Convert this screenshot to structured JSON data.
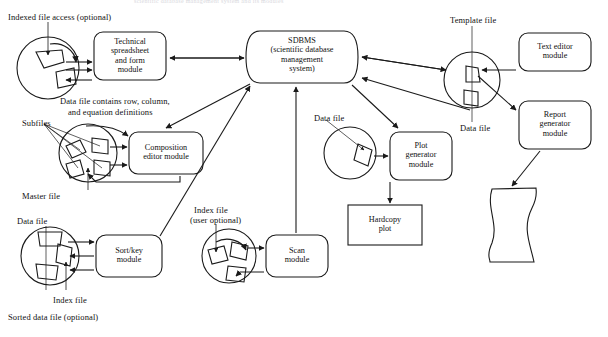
{
  "figure": {
    "top_cut_caption": "scientific database management system and its modules",
    "width": 608,
    "height": 337,
    "line_color": "#1a1a1a",
    "background": "#ffffff"
  },
  "modules": [
    {
      "id": "technical-spreadsheet",
      "lines": [
        "Technical",
        "spreadsheet",
        "and form",
        "module"
      ],
      "shape": "rounded-rect",
      "x": 94,
      "y": 32,
      "w": 72,
      "h": 48
    },
    {
      "id": "sdbms",
      "lines": [
        "SDBMS",
        "(scientific database",
        "management",
        "system)"
      ],
      "shape": "curved-cylinder",
      "x": 246,
      "y": 31,
      "w": 112,
      "h": 52
    },
    {
      "id": "composition-editor",
      "lines": [
        "Composition",
        "editor module"
      ],
      "shape": "rounded-rect",
      "x": 129,
      "y": 132,
      "w": 74,
      "h": 42
    },
    {
      "id": "sort-key",
      "lines": [
        "Sort/key",
        "module"
      ],
      "shape": "rounded-rect",
      "x": 96,
      "y": 235,
      "w": 66,
      "h": 42
    },
    {
      "id": "scan",
      "lines": [
        "Scan",
        "module"
      ],
      "shape": "rounded-rect",
      "x": 266,
      "y": 235,
      "w": 62,
      "h": 42
    },
    {
      "id": "plot-generator",
      "lines": [
        "Plot",
        "generator",
        "module"
      ],
      "shape": "rounded-rect",
      "x": 390,
      "y": 132,
      "w": 62,
      "h": 48
    },
    {
      "id": "hardcopy-plot",
      "lines": [
        "Hardcopy",
        "plot"
      ],
      "shape": "rect",
      "x": 348,
      "y": 205,
      "w": 74,
      "h": 40
    },
    {
      "id": "text-editor",
      "lines": [
        "Text editor",
        "module"
      ],
      "shape": "rounded-rect",
      "x": 519,
      "y": 33,
      "w": 72,
      "h": 38
    },
    {
      "id": "report-generator",
      "lines": [
        "Report",
        "generator",
        "module"
      ],
      "shape": "rounded-rect",
      "x": 519,
      "y": 101,
      "w": 72,
      "h": 48
    },
    {
      "id": "hardcopy-output",
      "lines": [
        "Hardcopy",
        "output"
      ],
      "shape": "torn-page",
      "x": 488,
      "y": 186,
      "w": 48,
      "h": 78
    }
  ],
  "disks": [
    {
      "id": "disk-indexed-access",
      "cx": 48,
      "cy": 68,
      "r": 31
    },
    {
      "id": "disk-subfiles",
      "cx": 88,
      "cy": 153,
      "r": 29
    },
    {
      "id": "disk-data-index",
      "cx": 50,
      "cy": 256,
      "r": 29
    },
    {
      "id": "disk-index-user-optional",
      "cx": 229,
      "cy": 256,
      "r": 27
    },
    {
      "id": "disk-plot-data",
      "cx": 350,
      "cy": 153,
      "r": 26
    },
    {
      "id": "disk-template",
      "cx": 472,
      "cy": 80,
      "r": 28
    }
  ],
  "annotations": [
    {
      "id": "indexed-file-access",
      "text": "Indexed file access (optional)",
      "x": 8,
      "y": 13
    },
    {
      "id": "data-file-contains",
      "text": "Data file contains row, column,",
      "x": 60,
      "y": 97
    },
    {
      "id": "and-equation-definitions",
      "text": "and equation definitions",
      "x": 68,
      "y": 108
    },
    {
      "id": "subfiles",
      "text": "Subfiles",
      "x": 22,
      "y": 119
    },
    {
      "id": "master-file",
      "text": "Master file",
      "x": 22,
      "y": 192
    },
    {
      "id": "data-file-sortkey",
      "text": "Data file",
      "x": 17,
      "y": 217
    },
    {
      "id": "index-file-sortkey",
      "text": "Index file",
      "x": 53,
      "y": 296
    },
    {
      "id": "sorted-data-file",
      "text": "Sorted data file (optional)",
      "x": 8,
      "y": 313
    },
    {
      "id": "index-file-user-optional-1",
      "text": "Index file",
      "x": 194,
      "y": 206
    },
    {
      "id": "index-file-user-optional-2",
      "text": "(user optional)",
      "x": 190,
      "y": 216
    },
    {
      "id": "data-file-plot",
      "text": "Data file",
      "x": 314,
      "y": 114
    },
    {
      "id": "template-file",
      "text": "Template file",
      "x": 450,
      "y": 16
    },
    {
      "id": "data-file-template",
      "text": "Data file",
      "x": 460,
      "y": 124
    },
    {
      "id": "hardcopy-output-label-1",
      "text": "Hardcopy",
      "x": 517,
      "y": 235
    },
    {
      "id": "hardcopy-output-label-2",
      "text": "output",
      "x": 522,
      "y": 246
    }
  ]
}
